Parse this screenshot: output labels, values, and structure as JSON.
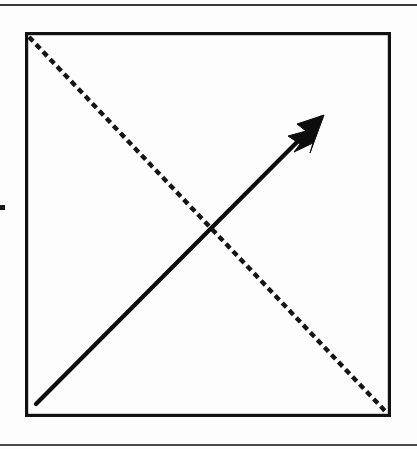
{
  "page": {
    "width": 417,
    "height": 449,
    "background_color": "#fdfdfd",
    "ink_color": "#111111"
  },
  "rules": {
    "top": {
      "label": "top-page-rule",
      "y": 4,
      "thickness": 2,
      "color": "#3b3b3b"
    },
    "bottom": {
      "label": "bottom-page-rule",
      "y": 444,
      "thickness": 2,
      "color": "#4a4a4a"
    }
  },
  "margin_mark": {
    "label": "left-margin-tick",
    "x": 0,
    "y": 205,
    "size": 5,
    "color": "#1a1a1a"
  },
  "figure": {
    "name": "diagonal-arrow-diagram",
    "box": {
      "label": "figure-frame",
      "x": 25,
      "y": 32,
      "width": 366,
      "height": 385,
      "stroke_width": 3.2,
      "color": "#111111"
    },
    "dashed_diagonal": {
      "label": "dashed-diagonal-line",
      "from": {
        "x": 4,
        "y": 5
      },
      "to": {
        "x": 362,
        "y": 381
      },
      "stroke_width": 4.4,
      "dash": "6 4.2",
      "color": "#141414",
      "direction": "top-left-to-bottom-right"
    },
    "solid_arrow": {
      "label": "solid-arrow",
      "from": {
        "x": 11,
        "y": 372
      },
      "to": {
        "x": 296,
        "y": 86
      },
      "stroke_width": 4.3,
      "color": "#0d0d0d",
      "direction": "bottom-left-to-top-right",
      "head": {
        "label": "arrow-head",
        "tip": {
          "x": 299,
          "y": 83
        },
        "points": "299,83 272,92 281,99 263,104 275,112 269,120 288,111 285,121"
      }
    },
    "intersection": {
      "x": 187,
      "y": 196
    }
  }
}
